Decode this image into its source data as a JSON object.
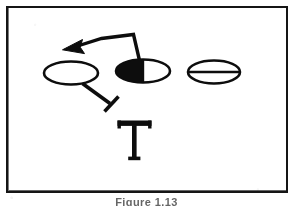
{
  "figure": {
    "caption": "Figure 1.13",
    "frame": {
      "border_color": "#151515",
      "background_color": "#ffffff"
    },
    "ink_color": "#0d0d0d",
    "canvas": {
      "width": 293,
      "height": 206
    }
  },
  "nodes": [
    {
      "id": "node-left",
      "label": "open-ellipse",
      "fill_style": "empty",
      "fill_color": "#ffffff",
      "stroke_color": "#0d0d0d",
      "cx": 71,
      "cy": 73,
      "rx": 27,
      "ry": 11.5
    },
    {
      "id": "node-middle",
      "label": "half-filled-ellipse",
      "fill_style": "left-half-filled",
      "fill_color": "#0d0d0d",
      "stroke_color": "#0d0d0d",
      "cx": 143,
      "cy": 71,
      "rx": 27,
      "ry": 11.5
    },
    {
      "id": "node-right",
      "label": "divided-ellipse",
      "fill_style": "horizontal-divider",
      "fill_color": "#ffffff",
      "stroke_color": "#0d0d0d",
      "cx": 214,
      "cy": 72,
      "rx": 26,
      "ry": 11.5
    }
  ],
  "connectors": [
    {
      "id": "connector-arrow",
      "type": "arrow",
      "from": "node-middle",
      "direction": "up-left",
      "head": "solid-triangle",
      "points": "139,59 132,32 100,36 70,45"
    },
    {
      "id": "connector-inhibition",
      "type": "inhibition",
      "from": "node-left",
      "direction": "down-right",
      "head": "t-bar",
      "points": "82,84 112,104"
    }
  ],
  "glyphs": [
    {
      "id": "glyph-t",
      "character": "T",
      "x": 134,
      "y": 143,
      "font_size": 46
    }
  ]
}
